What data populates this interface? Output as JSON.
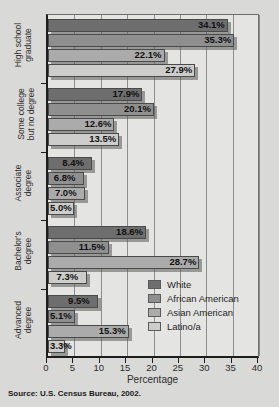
{
  "figure": {
    "clipped_title": "Educational attainment",
    "source": "Source: U.S. Census Bureau, 2002."
  },
  "chart_data": {
    "type": "bar",
    "orientation": "horizontal",
    "title": "",
    "xlabel": "Percentage",
    "ylabel": "",
    "xlim": [
      0,
      40
    ],
    "xticks": [
      0,
      5,
      10,
      15,
      20,
      25,
      30,
      35,
      40
    ],
    "grid": true,
    "grid_axis": "x",
    "legend_position": "inside lower-right",
    "categories": [
      "High school graduate",
      "Some college but no degree",
      "Associate degree",
      "Bachelor's degree",
      "Advanced degree"
    ],
    "category_lines": [
      [
        "High school",
        "graduate"
      ],
      [
        "Some college",
        "but no degree"
      ],
      [
        "Associate",
        "degree"
      ],
      [
        "Bachelor's",
        "degree"
      ],
      [
        "Advanced",
        "degree"
      ]
    ],
    "series": [
      {
        "name": "White",
        "color": "#6e6e6e",
        "values": [
          34.1,
          17.9,
          8.4,
          18.6,
          9.5
        ],
        "labels": [
          "34.1%",
          "17.9%",
          "8.4%",
          "18.6%",
          "9.5%"
        ]
      },
      {
        "name": "African American",
        "color": "#8f8f8f",
        "values": [
          35.3,
          20.1,
          6.8,
          11.5,
          5.1
        ],
        "labels": [
          "35.3%",
          "20.1%",
          "6.8%",
          "11.5%",
          "5.1%"
        ]
      },
      {
        "name": "Asian American",
        "color": "#ababab",
        "values": [
          22.1,
          12.6,
          7.0,
          28.7,
          15.3
        ],
        "labels": [
          "22.1%",
          "12.6%",
          "7.0%",
          "28.7%",
          "15.3%"
        ]
      },
      {
        "name": "Latino/a",
        "color": "#cdcdcb",
        "values": [
          27.9,
          13.5,
          5.0,
          7.3,
          3.3
        ],
        "labels": [
          "27.9%",
          "13.5%",
          "5.0%",
          "7.3%",
          "3.3%"
        ]
      }
    ]
  }
}
